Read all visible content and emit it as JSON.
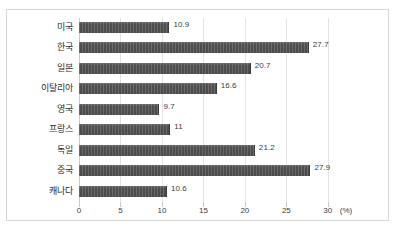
{
  "chart_data": {
    "type": "bar",
    "orientation": "horizontal",
    "title": "",
    "xlabel": "(%)",
    "ylabel": "",
    "categories": [
      "미국",
      "한국",
      "일본",
      "이탈리아",
      "영국",
      "프랑스",
      "독일",
      "중국",
      "캐나다"
    ],
    "values": [
      10.9,
      27.7,
      20.7,
      16.6,
      9.7,
      11,
      21.2,
      27.9,
      10.6
    ],
    "value_labels": [
      "10.9",
      "27.7",
      "20.7",
      "16.6",
      "9.7",
      "11",
      "21.2",
      "27.9",
      "10.6"
    ],
    "xlim": [
      0,
      34
    ],
    "xticks": [
      0,
      5,
      10,
      15,
      20,
      25,
      30
    ],
    "xtick_labels": [
      "0",
      "5",
      "10",
      "15",
      "20",
      "25",
      "30"
    ],
    "grid": true,
    "legend": false,
    "series_color": "#4a4a4a",
    "gridline_color": "#e3e3e3",
    "axis_color": "#c9c9c9",
    "frame_color": "#d7d7d7",
    "background": "#ffffff"
  }
}
